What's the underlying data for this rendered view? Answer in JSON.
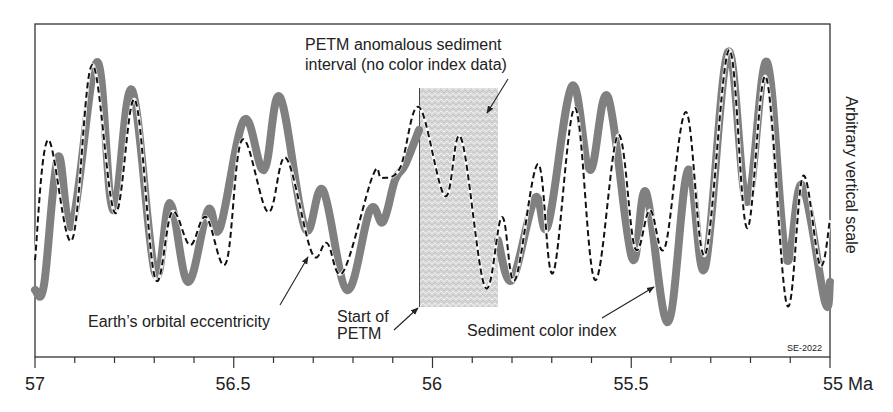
{
  "chart_data": {
    "type": "line",
    "title": "",
    "xlabel": "Ma",
    "ylabel": "Arbitrary vertical scale",
    "xlim": [
      57,
      55
    ],
    "x_reversed": true,
    "x_ticks": [
      "57",
      "56.5",
      "56",
      "55.5",
      "55 Ma"
    ],
    "x_tick_values": [
      57,
      56.5,
      56,
      55.5,
      55
    ],
    "minor_tick_step": 0.1,
    "grid": false,
    "credit": "SE-2022",
    "series": [
      {
        "name": "Sediment color index",
        "style": "thick gray solid",
        "color": "#808080",
        "gap": [
          56.04,
          55.84
        ],
        "points_px": [
          [
            35,
            290
          ],
          [
            44,
            285
          ],
          [
            58,
            157
          ],
          [
            72,
            225
          ],
          [
            97,
            62
          ],
          [
            113,
            210
          ],
          [
            132,
            90
          ],
          [
            155,
            273
          ],
          [
            170,
            203
          ],
          [
            188,
            282
          ],
          [
            208,
            210
          ],
          [
            220,
            228
          ],
          [
            244,
            120
          ],
          [
            264,
            170
          ],
          [
            280,
            97
          ],
          [
            305,
            228
          ],
          [
            323,
            190
          ],
          [
            347,
            290
          ],
          [
            370,
            210
          ],
          [
            383,
            222
          ],
          [
            395,
            180
          ],
          [
            405,
            165
          ],
          [
            419,
            130
          ]
        ],
        "points_px_after_gap": [
          [
            498,
            240
          ],
          [
            512,
            280
          ],
          [
            535,
            198
          ],
          [
            548,
            225
          ],
          [
            572,
            86
          ],
          [
            590,
            170
          ],
          [
            608,
            97
          ],
          [
            632,
            258
          ],
          [
            646,
            192
          ],
          [
            668,
            322
          ],
          [
            688,
            170
          ],
          [
            705,
            268
          ],
          [
            728,
            52
          ],
          [
            747,
            202
          ],
          [
            767,
            62
          ],
          [
            786,
            258
          ],
          [
            802,
            185
          ],
          [
            825,
            302
          ],
          [
            830,
            282
          ]
        ]
      },
      {
        "name": "Earth's orbital eccentricity",
        "style": "black dashed",
        "color": "#111111",
        "points_px": [
          [
            35,
            260
          ],
          [
            48,
            140
          ],
          [
            72,
            240
          ],
          [
            92,
            65
          ],
          [
            115,
            213
          ],
          [
            135,
            100
          ],
          [
            155,
            278
          ],
          [
            172,
            212
          ],
          [
            190,
            245
          ],
          [
            206,
            217
          ],
          [
            226,
            263
          ],
          [
            242,
            140
          ],
          [
            268,
            212
          ],
          [
            286,
            158
          ],
          [
            312,
            253
          ],
          [
            327,
            243
          ],
          [
            343,
            272
          ],
          [
            373,
            175
          ],
          [
            382,
            178
          ],
          [
            400,
            168
          ],
          [
            419,
            107
          ],
          [
            445,
            196
          ],
          [
            461,
            138
          ],
          [
            485,
            287
          ],
          [
            502,
            217
          ],
          [
            515,
            280
          ],
          [
            538,
            164
          ],
          [
            553,
            273
          ],
          [
            575,
            108
          ],
          [
            595,
            280
          ],
          [
            618,
            135
          ],
          [
            635,
            248
          ],
          [
            650,
            210
          ],
          [
            665,
            247
          ],
          [
            686,
            112
          ],
          [
            705,
            255
          ],
          [
            729,
            50
          ],
          [
            747,
            228
          ],
          [
            766,
            77
          ],
          [
            787,
            305
          ],
          [
            803,
            176
          ],
          [
            820,
            265
          ],
          [
            830,
            220
          ]
        ]
      }
    ],
    "shaded_region": {
      "label": "PETM anomalous sediment interval (no color index data)",
      "x_start_ma": 56.04,
      "x_end_ma": 55.84
    },
    "annotations": [
      {
        "text_lines": [
          "PETM anomalous sediment",
          "interval (no color index data)"
        ]
      },
      {
        "text_lines": [
          "Earth's orbital eccentricity"
        ]
      },
      {
        "text_lines": [
          "Start of",
          "PETM"
        ]
      },
      {
        "text_lines": [
          "Sediment color index"
        ]
      }
    ]
  },
  "labels": {
    "ylabel": "Arbitrary vertical scale",
    "credit": "SE-2022",
    "ann_petm_line1": "PETM anomalous sediment",
    "ann_petm_line2": "interval (no color index data)",
    "ann_ecc": "Earth’s orbital eccentricity",
    "ann_start1": "Start of",
    "ann_start2": "PETM",
    "ann_sed": "Sediment color index",
    "tick_57": "57",
    "tick_565": "56.5",
    "tick_56": "56",
    "tick_555": "55.5",
    "tick_55": "55 Ma"
  }
}
